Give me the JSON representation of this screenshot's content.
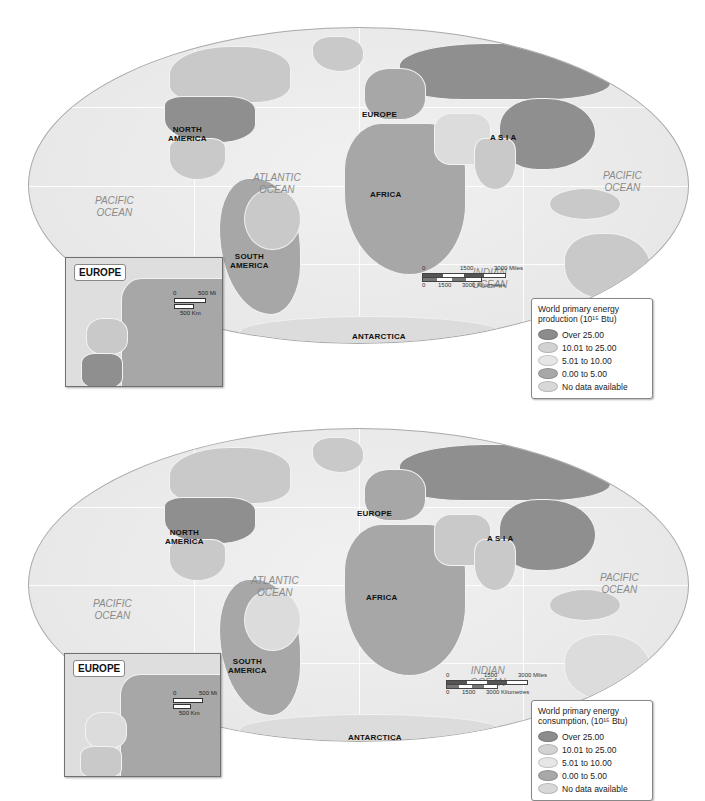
{
  "maps": [
    {
      "id": "production",
      "continents": {
        "north_america": "NORTH\nAMERICA",
        "south_america": "SOUTH\nAMERICA",
        "europe": "EUROPE",
        "africa": "AFRICA",
        "asia": "A S I A",
        "australia": "AUSTRALIA",
        "antarctica": "ANTARCTICA"
      },
      "oceans": {
        "pacific_west": "PACIFIC\nOCEAN",
        "atlantic": "ATLANTIC\nOCEAN",
        "indian": "INDIAN\nOCEAN",
        "pacific_east": "PACIFIC\nOCEAN"
      },
      "inset": {
        "title": "EUROPE",
        "scale_mi": "500 Mi",
        "scale_km": "500 Km",
        "scale_zero": "0"
      },
      "scale_bar": {
        "zero": "0",
        "mid_miles": "1500",
        "end_miles": "3000 Miles",
        "mid_km": "1500",
        "end_km": "3000 Kilometres"
      },
      "legend": {
        "title": "World primary energy production (10¹⁵ Btu)",
        "items": [
          {
            "label": "Over 25.00",
            "color": "#8c8c8c"
          },
          {
            "label": "10.01 to 25.00",
            "color": "#d2d2d2"
          },
          {
            "label": "5.01 to 10.00",
            "color": "#e6e6e6"
          },
          {
            "label": "0.00 to 5.00",
            "color": "#a8a8a8"
          },
          {
            "label": "No data available",
            "color": "#d8d8d8"
          }
        ]
      }
    },
    {
      "id": "consumption",
      "continents": {
        "north_america": "NORTH\nAMERICA",
        "south_america": "SOUTH\nAMERICA",
        "europe": "EUROPE",
        "africa": "AFRICA",
        "asia": "A S I A",
        "australia": "AUSTRALIA",
        "antarctica": "ANTARCTICA"
      },
      "oceans": {
        "pacific_west": "PACIFIC\nOCEAN",
        "atlantic": "ATLANTIC\nOCEAN",
        "indian": "INDIAN\nOCEAN",
        "pacific_east": "PACIFIC\nOCEAN"
      },
      "inset": {
        "title": "EUROPE",
        "scale_mi": "500 Mi",
        "scale_km": "500 Km",
        "scale_zero": "0"
      },
      "scale_bar": {
        "zero": "0",
        "mid_miles": "1500",
        "end_miles": "3000 Miles",
        "mid_km": "1500",
        "end_km": "3000 Kilometres"
      },
      "legend": {
        "title": "World primary energy consumption, (10¹⁵ Btu)",
        "items": [
          {
            "label": "Over 25.00",
            "color": "#8c8c8c"
          },
          {
            "label": "10.01 to 25.00",
            "color": "#d2d2d2"
          },
          {
            "label": "5.01 to 10.00",
            "color": "#e6e6e6"
          },
          {
            "label": "0.00 to 5.00",
            "color": "#a8a8a8"
          },
          {
            "label": "No data available",
            "color": "#d8d8d8"
          }
        ]
      }
    }
  ]
}
